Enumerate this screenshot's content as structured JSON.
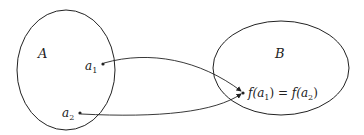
{
  "diagram": {
    "title": "",
    "sets": [
      {
        "id": "A",
        "label": "A"
      },
      {
        "id": "B",
        "label": "B"
      }
    ],
    "elements": [
      {
        "id": "a1",
        "base": "a",
        "sub": "1",
        "set": "A"
      },
      {
        "id": "a2",
        "base": "a",
        "sub": "2",
        "set": "A"
      },
      {
        "id": "fa",
        "set": "B",
        "text": {
          "f1": "f(",
          "a1": "a",
          "s1": "1",
          "close1": ")",
          "eq": " = ",
          "f2": "f(",
          "a2": "a",
          "s2": "2",
          "close2": ")"
        }
      }
    ],
    "arrows": [
      {
        "from": "a1",
        "to": "fa"
      },
      {
        "from": "a2",
        "to": "fa"
      }
    ],
    "colors": {
      "stroke": "#222222",
      "background": "#ffffff"
    }
  }
}
